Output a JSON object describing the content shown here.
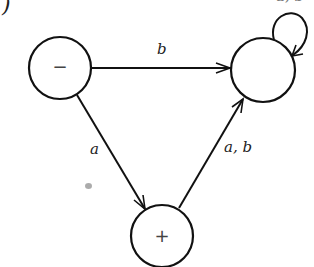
{
  "figure": {
    "mark": ")",
    "type": "finite automaton state diagram"
  },
  "states": [
    {
      "id": "minus",
      "label": "−",
      "cx": 60,
      "cy": 68,
      "r": 31
    },
    {
      "id": "unlabeled",
      "label": "",
      "cx": 263,
      "cy": 70,
      "r": 32
    },
    {
      "id": "plus",
      "label": "+",
      "cx": 162,
      "cy": 236,
      "r": 31
    }
  ],
  "edges": [
    {
      "from": "minus",
      "to": "unlabeled",
      "label": "b"
    },
    {
      "from": "minus",
      "to": "plus",
      "label": "a"
    },
    {
      "from": "plus",
      "to": "unlabeled",
      "label": "a, b"
    },
    {
      "from": "unlabeled",
      "to": "unlabeled",
      "label": "a, b",
      "note": "self-loop label cropped at top edge"
    }
  ],
  "labels": {
    "edge_b": "b",
    "edge_a": "a",
    "edge_ab": "a, b",
    "loop_ab": "a, b"
  },
  "colors": {
    "stroke": "#111111",
    "background": "#ffffff"
  }
}
